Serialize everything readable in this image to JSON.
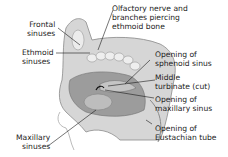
{
  "diagram": {
    "labels": {
      "frontal": [
        "Frontal",
        "sinuses"
      ],
      "ethmoid": [
        "Ethmoid",
        "sinuses"
      ],
      "maxillary": [
        "Maxillary",
        "sinuses"
      ],
      "olfactory": [
        "Olfactory nerve and",
        "branches piercing",
        "ethmoid bone"
      ],
      "sphenoid_opening": [
        "Opening of",
        "sphenoid sinus"
      ],
      "middle_turbinate": [
        "Middle",
        "turbinate (cut)"
      ],
      "maxillary_opening": [
        "Opening of",
        "maxillary sinus"
      ],
      "eustachian_opening": [
        "Opening of",
        "Eustachian tube"
      ]
    },
    "colors": {
      "tissue_light": "#d9d9d9",
      "tissue_mid": "#a8a8a8",
      "tissue_dark": "#6e6e6e",
      "leader_line": "#1a1a1a"
    }
  }
}
